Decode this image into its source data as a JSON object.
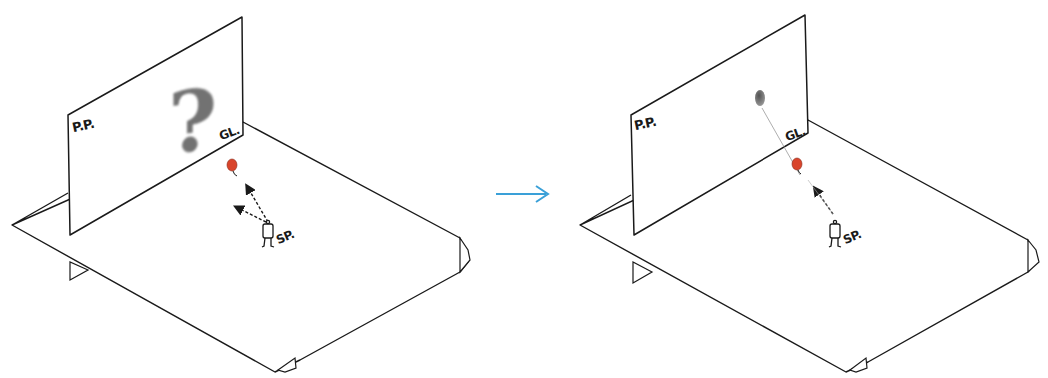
{
  "figure": {
    "colors": {
      "stroke": "#1a1a1a",
      "balloon": "#d9442b",
      "transition_arrow": "#3aa0d8",
      "shadow": "#555555"
    }
  },
  "panels": [
    {
      "id": "before",
      "labels": {
        "picture_plane": "P.P.",
        "ground_line": "GL.",
        "station_point": "SP."
      },
      "projection_symbol": "?",
      "sight_arrows": 2
    },
    {
      "id": "after",
      "labels": {
        "picture_plane": "P.P.",
        "ground_line": "GL.",
        "station_point": "SP."
      },
      "projection_symbol": "balloon-projection",
      "sight_arrows": 1
    }
  ],
  "transition": {
    "icon": "right-arrow-icon"
  }
}
